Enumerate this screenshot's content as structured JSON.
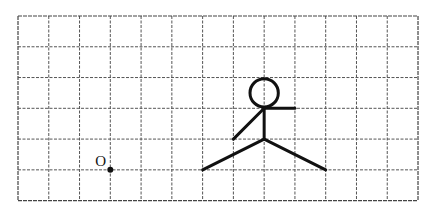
{
  "diagram": {
    "grid": {
      "columns": 13,
      "rows": 6,
      "origin_px": [
        18,
        16
      ],
      "cell_px": 30.77,
      "line_color": "#555555",
      "line_style": "dashed"
    },
    "point": {
      "label": "O",
      "grid_pos": [
        3,
        5
      ],
      "color": "#111111"
    },
    "stick_figure": {
      "head": {
        "center_grid": [
          8,
          2.5
        ],
        "radius_cells": 0.46
      },
      "neck_grid": [
        8,
        3
      ],
      "body_end_grid": [
        8,
        4
      ],
      "right_arm_end_grid": [
        9,
        3
      ],
      "left_arm_end_grid": [
        7,
        4
      ],
      "left_leg_end_grid": [
        6,
        5
      ],
      "right_leg_end_grid": [
        10,
        5
      ],
      "color": "#111111"
    }
  }
}
